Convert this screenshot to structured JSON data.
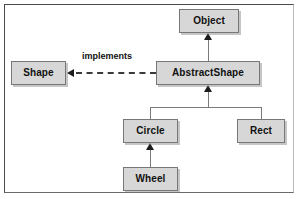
{
  "diagram": {
    "kind": "uml-class-diagram",
    "background_color": "#ffffff",
    "frame_border_color": "#4a4a4a",
    "box_fill_color": "#d7d7d7",
    "box_border_color": "#777777",
    "connector_color": "#7a7a7a",
    "arrow_color": "#1c1c1c",
    "text_color": "#111111",
    "nodes": [
      {
        "id": "object",
        "label": "Object",
        "x": 179,
        "y": 9,
        "w": 60,
        "h": 24
      },
      {
        "id": "shape",
        "label": "Shape",
        "x": 11,
        "y": 61,
        "w": 55,
        "h": 24
      },
      {
        "id": "abstractshape",
        "label": "AbstractShape",
        "x": 156,
        "y": 61,
        "w": 104,
        "h": 24
      },
      {
        "id": "circle",
        "label": "Circle",
        "x": 123,
        "y": 119,
        "w": 55,
        "h": 24
      },
      {
        "id": "rect",
        "label": "Rect",
        "x": 237,
        "y": 119,
        "w": 48,
        "h": 24
      },
      {
        "id": "wheel",
        "label": "Wheel",
        "x": 123,
        "y": 167,
        "w": 55,
        "h": 24
      }
    ],
    "edges": [
      {
        "id": "abstractshape-extends-object",
        "from": "abstractshape",
        "to": "object",
        "type": "generalization",
        "label": ""
      },
      {
        "id": "abstractshape-implements-shape",
        "from": "abstractshape",
        "to": "shape",
        "type": "realization",
        "label": "implements"
      },
      {
        "id": "circle-extends-abstractshape",
        "from": "circle",
        "to": "abstractshape",
        "type": "generalization",
        "label": ""
      },
      {
        "id": "rect-extends-abstractshape",
        "from": "rect",
        "to": "abstractshape",
        "type": "generalization",
        "label": ""
      },
      {
        "id": "wheel-extends-circle",
        "from": "wheel",
        "to": "circle",
        "type": "generalization",
        "label": ""
      }
    ],
    "labels": {
      "implements": "implements"
    }
  }
}
